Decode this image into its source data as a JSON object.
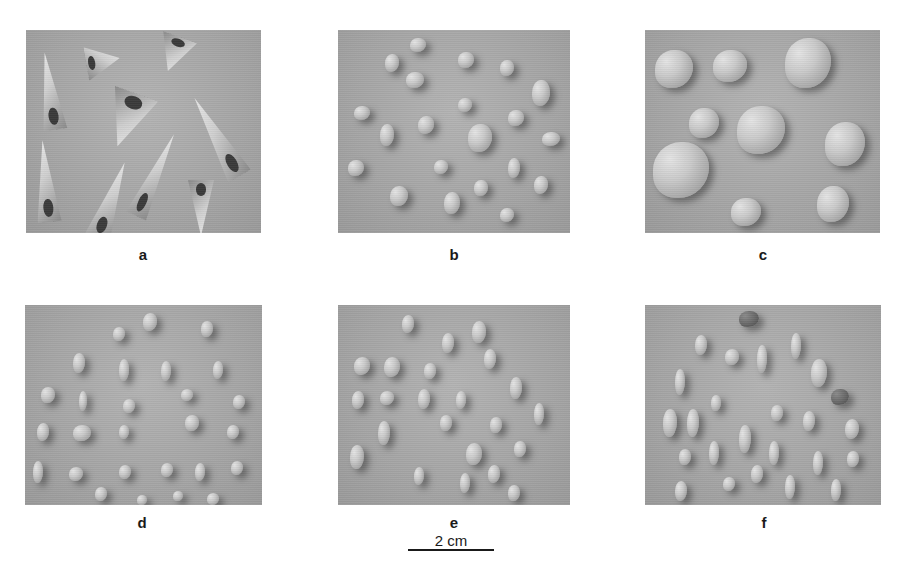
{
  "figure": {
    "panels": [
      {
        "id": "a",
        "label": "a",
        "content": "high-spired turreted gastropod shells with ribbed whorls and dark apertures",
        "item_count": 9
      },
      {
        "id": "b",
        "label": "b",
        "content": "small rounded-angular grains / shell fragments",
        "item_count": 22
      },
      {
        "id": "c",
        "label": "c",
        "content": "large rounded and triangular shell fragments / pebbles",
        "item_count": 9
      },
      {
        "id": "d",
        "label": "d",
        "content": "small elongate and rounded grains",
        "item_count": 32
      },
      {
        "id": "e",
        "label": "e",
        "content": "elongate ovoid grains",
        "item_count": 30
      },
      {
        "id": "f",
        "label": "f",
        "content": "elongate spindle-shaped grains with a few darker fragments",
        "item_count": 30
      }
    ],
    "scale_bar": {
      "label": "2 cm",
      "length_px": 86
    }
  }
}
